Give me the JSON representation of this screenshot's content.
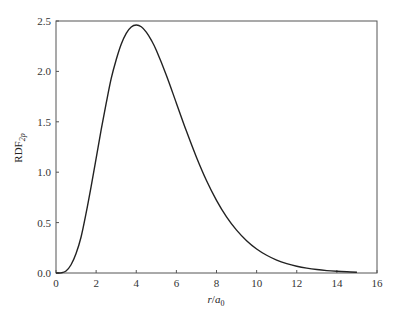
{
  "chart_data": {
    "type": "line",
    "title": "",
    "xlabel": "r/a0",
    "xlabel_parts": {
      "var": "r",
      "sep": "/",
      "base": "a",
      "sub": "0"
    },
    "ylabel": "RDF2p",
    "ylabel_parts": {
      "base": "RDF",
      "sub": "2p"
    },
    "xlim": [
      0,
      16
    ],
    "ylim": [
      0,
      2.5
    ],
    "xticks": [
      0,
      2,
      4,
      6,
      8,
      10,
      12,
      14,
      16
    ],
    "xtick_labels": [
      "0",
      "2",
      "4",
      "6",
      "8",
      "10",
      "12",
      "14",
      "16"
    ],
    "yticks": [
      0,
      0.5,
      1.0,
      1.5,
      2.0,
      2.5
    ],
    "ytick_labels": [
      "0.0",
      "0.5",
      "1.0",
      "1.5",
      "2.0",
      "2.5"
    ],
    "grid": false,
    "legend": null,
    "series": [
      {
        "name": "RDF 2p",
        "color": "#222222",
        "x": [
          0,
          0.25,
          0.5,
          0.75,
          1,
          1.25,
          1.5,
          1.75,
          2,
          2.25,
          2.5,
          2.75,
          3,
          3.25,
          3.5,
          3.75,
          4,
          4.25,
          4.5,
          4.75,
          5,
          5.5,
          6,
          6.5,
          7,
          7.5,
          8,
          8.5,
          9,
          9.5,
          10,
          10.5,
          11,
          11.5,
          12,
          12.5,
          13,
          13.5,
          14,
          14.5,
          15
        ],
        "y": [
          0,
          0.0016,
          0.0199,
          0.0818,
          0.193,
          0.357,
          0.593,
          0.857,
          1.136,
          1.42,
          1.682,
          1.928,
          2.116,
          2.27,
          2.378,
          2.441,
          2.46,
          2.443,
          2.39,
          2.31,
          2.209,
          1.962,
          1.685,
          1.408,
          1.149,
          0.918,
          0.721,
          0.557,
          0.425,
          0.32,
          0.238,
          0.176,
          0.128,
          0.093,
          0.067,
          0.048,
          0.034,
          0.024,
          0.017,
          0.012,
          0.008
        ]
      }
    ]
  }
}
